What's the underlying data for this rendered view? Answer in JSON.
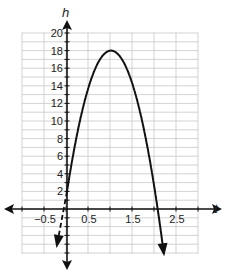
{
  "chart_data": {
    "type": "line",
    "title": "",
    "xlabel": "t",
    "ylabel": "h",
    "xlim": [
      -1.0,
      3.0
    ],
    "ylim": [
      -5,
      20
    ],
    "grid": true,
    "x_ticks": [
      "-0.5",
      "0.5",
      "1.5",
      "2.5"
    ],
    "y_ticks": [
      "2",
      "4",
      "6",
      "8",
      "10",
      "12",
      "14",
      "16",
      "18",
      "20"
    ],
    "series": [
      {
        "name": "h(t) = -16t^2 + 32t + 2",
        "style": "solid",
        "t_start": 0,
        "t_end": 2.2,
        "peak": {
          "t": 1.0,
          "h": 18
        },
        "h_intercept": 2
      },
      {
        "name": "extension",
        "style": "dashed",
        "x": [
          0,
          -0.22
        ],
        "y": [
          2,
          -4.3
        ]
      }
    ]
  },
  "labels": {
    "x_axis": "t",
    "y_axis": "h"
  }
}
